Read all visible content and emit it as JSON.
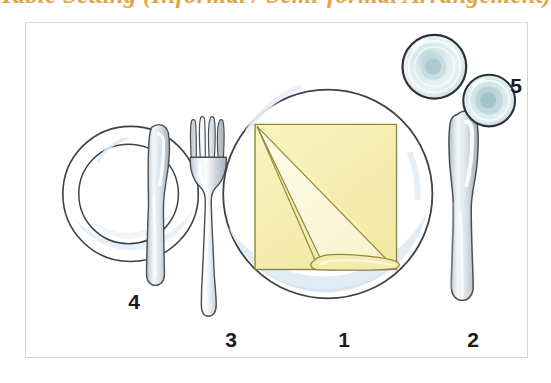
{
  "title": {
    "text": "Table Setting (Informal / Semi-formal Arrangement)",
    "color": "#e8a33d"
  },
  "figure": {
    "name": "table-setting-diagram",
    "frame_color": "#d5d7da",
    "background": "#ffffff",
    "callouts": [
      {
        "id": "1",
        "label": "1",
        "refers_to": "dinner-plate-with-folded-napkin"
      },
      {
        "id": "2",
        "label": "2",
        "refers_to": "dinner-knife"
      },
      {
        "id": "3",
        "label": "3",
        "refers_to": "dinner-fork"
      },
      {
        "id": "4",
        "label": "4",
        "refers_to": "side-plate-with-butter-knife"
      },
      {
        "id": "5",
        "label": "5",
        "refers_to": "drinking-glasses"
      }
    ],
    "items": {
      "dinner_plate": {
        "name": "dinner-plate",
        "rim_color": "#3d4248",
        "fill_color": "#ffffff",
        "shade_color": "#dce9f4"
      },
      "napkin": {
        "name": "folded-napkin",
        "fill_color": "#f7efb6",
        "fold_color": "#fdf8d8",
        "outline_color": "#8f8a3c",
        "shape": "square with diagonal fold and rolled bottom edge"
      },
      "side_plate": {
        "name": "side-plate",
        "rim_color": "#3d4248",
        "fill_color": "#ffffff",
        "shade_color": "#e3eff8"
      },
      "butter_knife": {
        "name": "butter-knife",
        "metal_color": "#d4dbe2",
        "outline_color": "#4a4f55"
      },
      "fork": {
        "name": "dinner-fork",
        "tines": 4,
        "metal_color": "#d4dbe2",
        "outline_color": "#4a4f55"
      },
      "knife": {
        "name": "dinner-knife",
        "metal_color": "#d4dbe2",
        "outline_color": "#4a4f55"
      },
      "glass_large": {
        "name": "water-glass",
        "fill_color": "#cfe3e2",
        "rim_color": "#2b3136",
        "view": "top-down with concentric rings"
      },
      "glass_small": {
        "name": "wine-glass",
        "fill_color": "#bcd6dd",
        "rim_color": "#2b3136",
        "view": "top-down with concentric rings"
      }
    }
  }
}
